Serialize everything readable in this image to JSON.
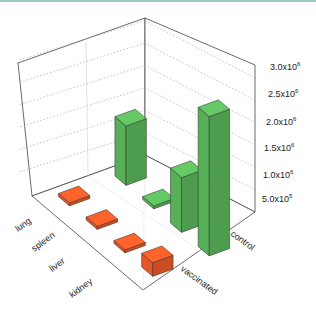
{
  "chart_data": {
    "type": "bar3d",
    "title": "",
    "x_categories": [
      "lung",
      "spleen",
      "liver",
      "kidney"
    ],
    "y_categories": [
      "vaccinated",
      "control"
    ],
    "z_ticks": [
      "5.0x10^5",
      "1.0x10^6",
      "1.5x10^6",
      "2.0x10^6",
      "2.5x10^6",
      "3.0x10^6"
    ],
    "z_tick_labels": [
      {
        "mant": "5.0x10",
        "exp": "5"
      },
      {
        "mant": "1.0x10",
        "exp": "6"
      },
      {
        "mant": "1.5x10",
        "exp": "6"
      },
      {
        "mant": "2.0x10",
        "exp": "6"
      },
      {
        "mant": "2.5x10",
        "exp": "6"
      },
      {
        "mant": "3.0x10",
        "exp": "6"
      }
    ],
    "zlim": [
      0,
      3000000
    ],
    "series": [
      {
        "name": "vaccinated",
        "color": "#f05a28",
        "values": [
          50000,
          50000,
          40000,
          300000
        ]
      },
      {
        "name": "control",
        "color": "#5cb85c",
        "values": [
          1300000,
          50000,
          1200000,
          3050000
        ]
      }
    ],
    "grid": true,
    "legend": "none"
  }
}
